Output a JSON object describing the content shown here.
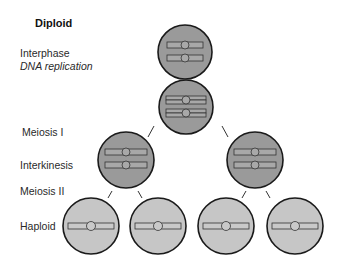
{
  "title": "Diploid",
  "stages": {
    "interphase": "Interphase",
    "dna_replication": "DNA replication",
    "meiosis_1": "Meiosis I",
    "interkinesis": "Interkinesis",
    "meiosis_2": "Meiosis II",
    "haploid": "Haploid"
  },
  "colors": {
    "diploid_cell": "#9a9a9a",
    "haploid_cell": "#c6c6c6",
    "outline": "#1a1a1a",
    "chromosome_diploid": "#a8a8a8",
    "chromosome_haploid": "#c9c9c9"
  },
  "cells": [
    {
      "name": "interphase-cell",
      "cx": 185,
      "cy": 52,
      "r": 27,
      "ploidy": "diploid",
      "chromosomes": "2 single"
    },
    {
      "name": "replicated-cell",
      "cx": 186,
      "cy": 107,
      "r": 27,
      "ploidy": "diploid",
      "chromosomes": "2 replicated"
    },
    {
      "name": "interkinesis-cell-left",
      "cx": 126,
      "cy": 160,
      "r": 28,
      "ploidy": "diploid",
      "chromosomes": "2 replicated"
    },
    {
      "name": "interkinesis-cell-right",
      "cx": 255,
      "cy": 160,
      "r": 28,
      "ploidy": "diploid",
      "chromosomes": "2 replicated"
    },
    {
      "name": "haploid-cell-1",
      "cx": 91,
      "cy": 226,
      "r": 28,
      "ploidy": "haploid",
      "chromosomes": "1"
    },
    {
      "name": "haploid-cell-2",
      "cx": 158,
      "cy": 226,
      "r": 28,
      "ploidy": "haploid",
      "chromosomes": "1"
    },
    {
      "name": "haploid-cell-3",
      "cx": 226,
      "cy": 226,
      "r": 28,
      "ploidy": "haploid",
      "chromosomes": "1"
    },
    {
      "name": "haploid-cell-4",
      "cx": 295,
      "cy": 226,
      "r": 28,
      "ploidy": "haploid",
      "chromosomes": "1"
    }
  ]
}
